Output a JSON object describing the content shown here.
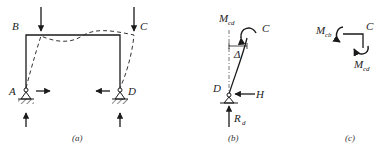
{
  "panels": {
    "a": {
      "caption": "(a)",
      "labels": {
        "B": "B",
        "C": "C",
        "A": "A",
        "D": "D"
      }
    },
    "b": {
      "caption": "(b)",
      "labels": {
        "moment": "M",
        "moment_sub": "cd",
        "C": "C",
        "delta": "Δ",
        "D": "D",
        "H": "H",
        "reaction": "R",
        "reaction_sub": "d"
      }
    },
    "c": {
      "caption": "(c)",
      "labels": {
        "mcb": "M",
        "mcb_sub": "cb",
        "C": "C",
        "mcd": "M",
        "mcd_sub": "cd"
      }
    }
  },
  "colors": {
    "line": "#1a1a1a",
    "dashed": "#333333"
  }
}
